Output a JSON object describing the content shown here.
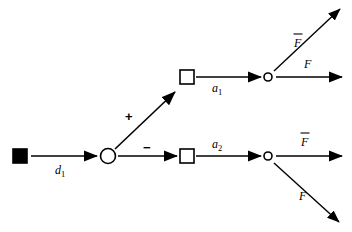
{
  "diagram": {
    "type": "signal-flow-graph",
    "background_color": "#ffffff",
    "stroke_color": "#000000",
    "nodes": [
      {
        "id": "source",
        "shape": "filled-square",
        "label": "",
        "x": 20,
        "y": 156
      },
      {
        "id": "junction",
        "shape": "open-circle",
        "label": "",
        "x": 108,
        "y": 156
      },
      {
        "id": "block-upper",
        "shape": "open-square",
        "label": "",
        "x": 187,
        "y": 77
      },
      {
        "id": "block-lower",
        "shape": "open-square",
        "label": "",
        "x": 187,
        "y": 156
      },
      {
        "id": "split-upper",
        "shape": "small-open-circle",
        "label": "",
        "x": 268,
        "y": 77
      },
      {
        "id": "split-lower",
        "shape": "small-open-circle",
        "label": "",
        "x": 268,
        "y": 156
      }
    ],
    "edges": [
      {
        "id": "source-to-junction",
        "from": "source",
        "to": "junction",
        "label": "d",
        "subscript": "1",
        "overbar": false,
        "direction": "right"
      },
      {
        "id": "junction-to-block-upper",
        "from": "junction",
        "to": "block-upper",
        "label": "+",
        "subscript": "",
        "overbar": false,
        "direction": "up-right"
      },
      {
        "id": "junction-to-block-lower",
        "from": "junction",
        "to": "block-lower",
        "label": "−",
        "subscript": "",
        "overbar": false,
        "direction": "right"
      },
      {
        "id": "block-upper-to-split-upper",
        "from": "block-upper",
        "to": "split-upper",
        "label": "a",
        "subscript": "1",
        "overbar": false,
        "direction": "right"
      },
      {
        "id": "block-lower-to-split-lower",
        "from": "block-lower",
        "to": "split-lower",
        "label": "a",
        "subscript": "2",
        "overbar": false,
        "direction": "right"
      },
      {
        "id": "split-upper-out-diagonal",
        "from": "split-upper",
        "to": "",
        "label": "F",
        "subscript": "",
        "overbar": true,
        "direction": "up-right"
      },
      {
        "id": "split-upper-out-horizontal",
        "from": "split-upper",
        "to": "",
        "label": "F",
        "subscript": "",
        "overbar": false,
        "direction": "right"
      },
      {
        "id": "split-lower-out-horizontal",
        "from": "split-lower",
        "to": "",
        "label": "F",
        "subscript": "",
        "overbar": true,
        "direction": "right"
      },
      {
        "id": "split-lower-out-diagonal",
        "from": "split-lower",
        "to": "",
        "label": "F",
        "subscript": "",
        "overbar": false,
        "direction": "down-right"
      }
    ],
    "labels": {
      "d1": "d",
      "d1_sub": "1",
      "plus": "+",
      "minus": "−",
      "a1": "a",
      "a1_sub": "1",
      "a2": "a",
      "a2_sub": "2",
      "f_bar_upper": "F",
      "f_upper": "F",
      "f_bar_lower": "F",
      "f_lower": "F"
    }
  }
}
